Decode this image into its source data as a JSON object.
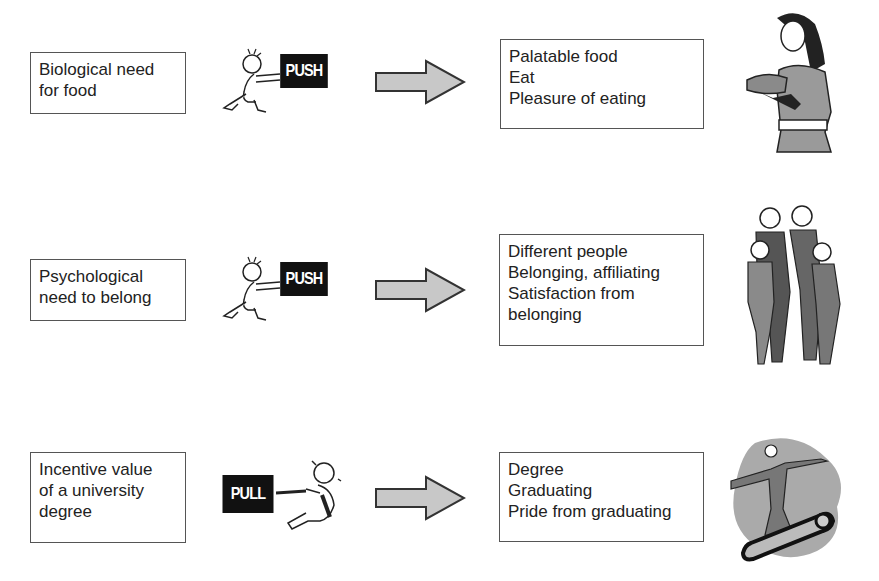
{
  "rows": [
    {
      "cause": {
        "lines": [
          "Biological need",
          "for food"
        ]
      },
      "force": {
        "type": "push",
        "label": "PUSH"
      },
      "outcome": {
        "lines": [
          "Palatable food",
          "Eat",
          "Pleasure of eating"
        ]
      },
      "illustration": "woman-holding-food"
    },
    {
      "cause": {
        "lines": [
          "Psychological",
          "need to belong"
        ]
      },
      "force": {
        "type": "push",
        "label": "PUSH"
      },
      "outcome": {
        "lines": [
          "Different people",
          "Belonging, affiliating",
          "Satisfaction from",
          "belonging"
        ]
      },
      "illustration": "group-of-people"
    },
    {
      "cause": {
        "lines": [
          "Incentive value",
          "of a university",
          "degree"
        ]
      },
      "force": {
        "type": "pull",
        "label": "PULL"
      },
      "outcome": {
        "lines": [
          "Degree",
          "Graduating",
          "Pride from graduating"
        ]
      },
      "illustration": "graduate-on-diploma-scroll"
    }
  ],
  "colors": {
    "arrow_fill": "#c8c8c8",
    "arrow_stroke": "#333333",
    "sign_bg": "#111111",
    "box_border": "#555555",
    "figure_gray": "#9a9a9a"
  }
}
